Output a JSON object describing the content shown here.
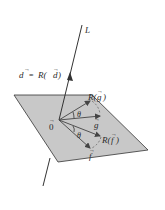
{
  "diagram": {
    "line_label": "L",
    "origin_label": "0",
    "d_label": "d = R(d)",
    "d_lhs": "d",
    "d_eq": "=",
    "d_rhs_func": "R(",
    "d_rhs_arg": "d",
    "d_rhs_close": ")",
    "Rg_label_func": "R(",
    "Rg_label_arg": "g",
    "Rg_label_close": ")",
    "g_label": "g",
    "Rf_label_func": "R(",
    "Rf_label_arg": "f",
    "Rf_label_close": ")",
    "f_label": "f",
    "theta_upper": "θ",
    "theta_lower": "θ",
    "colors": {
      "plane_fill": "#c8c8c8",
      "plane_stroke": "#333333",
      "line": "#333333",
      "vector": "#444444"
    }
  }
}
